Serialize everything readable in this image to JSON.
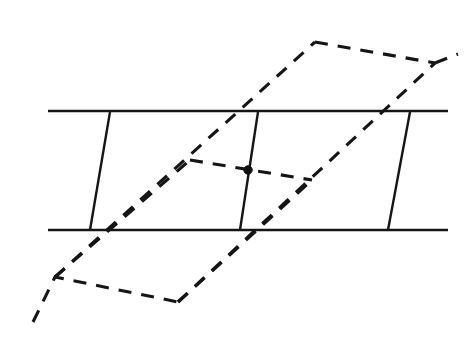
{
  "figure": {
    "canvas": {
      "width": 474,
      "height": 363,
      "background": "#ffffff"
    },
    "stroke_color": "#151515",
    "dot_color": "#101010",
    "solid_stroke_width": 2.4,
    "dashed_stroke_width": 3.1,
    "dash_pattern": "13 10",
    "solid_elements": [
      {
        "name": "top-horizontal-line",
        "kind": "segment",
        "points": "48,111 448,111"
      },
      {
        "name": "bottom-horizontal-line",
        "kind": "segment",
        "points": "48,230 448,230"
      },
      {
        "name": "left-vertical-line",
        "kind": "segment",
        "points": "110,112 90,230"
      },
      {
        "name": "middle-vertical-line",
        "kind": "segment",
        "points": "258,112 240,230"
      },
      {
        "name": "right-vertical-line",
        "kind": "segment",
        "points": "410,112 388,230"
      }
    ],
    "dashed_elements": [
      {
        "name": "lower-dashed-parallelogram-path",
        "kind": "polyline",
        "points": "33,322 55,277 178,302"
      },
      {
        "name": "left-dashed-rising-edge",
        "kind": "segment",
        "points": "55,277 190,160"
      },
      {
        "name": "middle-dashed-crossbar",
        "kind": "segment",
        "points": "190,160 312,180"
      },
      {
        "name": "lower-right-dashed-rising-edge",
        "kind": "segment",
        "points": "178,302 312,180"
      },
      {
        "name": "long-dashed-left-diagonal",
        "kind": "segment",
        "points": "55,277 315,42"
      },
      {
        "name": "upper-dashed-top-edge",
        "kind": "segment",
        "points": "315,42 435,63"
      },
      {
        "name": "upper-dashed-right-diagonal",
        "kind": "segment",
        "points": "435,63 458,54"
      },
      {
        "name": "long-dashed-right-diagonal",
        "kind": "segment",
        "points": "178,302 435,63"
      }
    ],
    "points": [
      {
        "name": "intersection-point",
        "kind": "dot",
        "cx": 248,
        "cy": 170,
        "r": 4.2
      }
    ]
  }
}
